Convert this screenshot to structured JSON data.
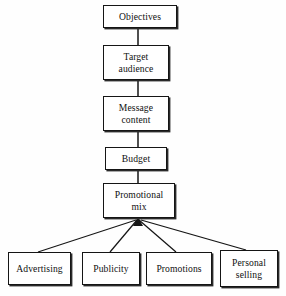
{
  "diagram": {
    "orientation": "top-down",
    "stroke_color": "#151515",
    "box_fill_color": "#ffffff",
    "background_color": "#fefefe",
    "chain": [
      {
        "id": "objectives",
        "label": "Objectives"
      },
      {
        "id": "target-audience",
        "label": "Target\naudience"
      },
      {
        "id": "message-content",
        "label": "Message\ncontent"
      },
      {
        "id": "budget",
        "label": "Budget"
      },
      {
        "id": "promotional-mix",
        "label": "Promotional\nmix"
      }
    ],
    "branches": [
      {
        "id": "advertising",
        "label": "Advertising"
      },
      {
        "id": "publicity",
        "label": "Publicity"
      },
      {
        "id": "promotions",
        "label": "Promotions"
      },
      {
        "id": "personal-selling",
        "label": "Personal\nselling"
      }
    ]
  }
}
